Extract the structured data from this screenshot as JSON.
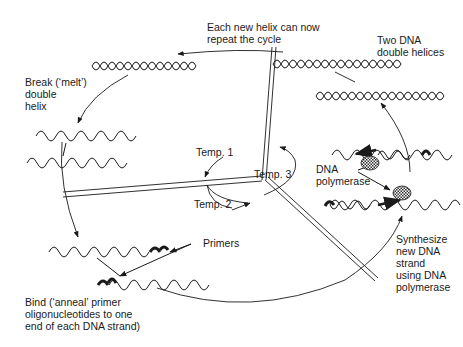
{
  "diagram": {
    "colors": {
      "ink": "#1a1a1a",
      "background": "#ffffff",
      "enzyme_fill": "#555555"
    },
    "labels": {
      "repeat": "Each new helix can now\nrepeat the cycle",
      "two_helices": "Two DNA\ndouble helices",
      "melt": "Break (‘melt’)\ndouble\nhelix",
      "dna_polymerase": "DNA\npolymerase",
      "synthesize": "Synthesize\nnew DNA\nstrand\nusing DNA\npolymerase",
      "primers": "Primers",
      "anneal": "Bind (‘anneal’ primer\noligonucleotides to one\nend of each DNA strand)",
      "temp1": "Temp. 1",
      "temp2": "Temp. 2",
      "temp3": "Temp. 3"
    },
    "steps": [
      {
        "name": "melt",
        "temperature": "Temp. 1"
      },
      {
        "name": "anneal",
        "temperature": "Temp. 2"
      },
      {
        "name": "synthesize",
        "temperature": "Temp. 3"
      },
      {
        "name": "two-helices-repeat"
      }
    ]
  }
}
